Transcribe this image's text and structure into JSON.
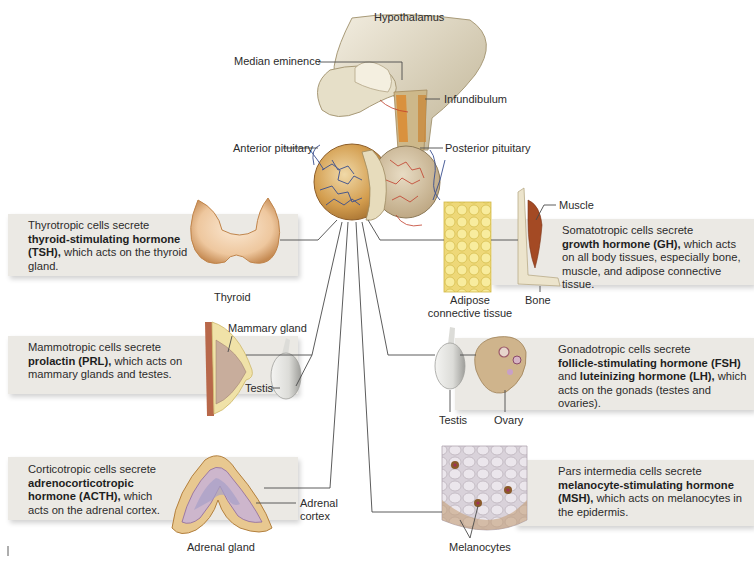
{
  "figure": {
    "structures": {
      "hypothalamus": "Hypothalamus",
      "median_eminence": "Median eminence",
      "infundibulum": "Infundibulum",
      "anterior_pituitary": "Anterior pituitary",
      "posterior_pituitary": "Posterior pituitary"
    },
    "panels": [
      {
        "id": "tsh",
        "line1": "Thyrotropic cells secrete",
        "bold": "thyroid-stimulating hormone (TSH),",
        "rest": " which acts on the thyroid gland.",
        "targets": [
          "Thyroid"
        ]
      },
      {
        "id": "gh",
        "line1": "Somatotropic cells secrete",
        "bold": "growth hormone (GH),",
        "rest": " which acts on all body tissues, especially bone, muscle, and adipose connective tissue.",
        "targets": [
          "Muscle",
          "Adipose connective tissue",
          "Bone"
        ]
      },
      {
        "id": "prl",
        "line1": "Mammotropic cells secrete",
        "bold": "prolactin (PRL),",
        "rest": " which acts on mammary glands and testes.",
        "targets": [
          "Mammary gland",
          "Testis"
        ]
      },
      {
        "id": "fsh_lh",
        "line1": "Gonadotropic cells secrete",
        "bold": "follicle-stimulating hormone (FSH)",
        "mid": " and ",
        "bold2": "luteinizing hormone (LH),",
        "rest": " which acts on the gonads (testes and ovaries).",
        "targets": [
          "Testis",
          "Ovary"
        ]
      },
      {
        "id": "acth",
        "line1": "Corticotropic cells secrete",
        "bold": "adrenocorticotropic hormone (ACTH),",
        "rest": " which acts on the adrenal cortex.",
        "targets": [
          "Adrenal cortex",
          "Adrenal gland"
        ]
      },
      {
        "id": "msh",
        "line1": "Pars intermedia cells secrete",
        "bold": "melanocyte-stimulating hormone (MSH),",
        "rest": " which acts on melanocytes in the epidermis.",
        "targets": [
          "Melanocytes"
        ]
      }
    ],
    "labels": {
      "thyroid": "Thyroid",
      "muscle": "Muscle",
      "adipose_1": "Adipose",
      "adipose_2": "connective tissue",
      "bone": "Bone",
      "mammary_gland": "Mammary gland",
      "testis_left": "Testis",
      "testis_right": "Testis",
      "ovary": "Ovary",
      "adrenal_cortex_1": "Adrenal",
      "adrenal_cortex_2": "cortex",
      "adrenal_gland": "Adrenal gland",
      "melanocytes": "Melanocytes"
    },
    "colors": {
      "panel_bg": "#ebe9e4",
      "leader_line": "#4a4a4a",
      "vessel_blue": "#3a4f8f",
      "vessel_red": "#c2412e",
      "pituitary_tan": "#c9913f",
      "neural_tissue": "#d8d0b8"
    }
  }
}
